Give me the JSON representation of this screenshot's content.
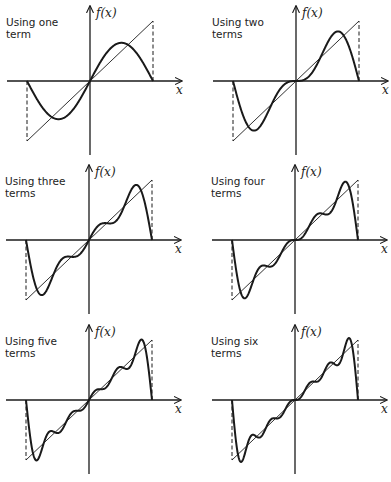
{
  "figure": {
    "background": "#ffffff",
    "ink": "#1a1a1a"
  },
  "chart_data": [
    {
      "type": "line",
      "title": "Using one term",
      "label_lines": [
        "Using one",
        "term"
      ],
      "terms": 1,
      "xlabel": "x",
      "ylabel": "f(x)",
      "xlim": [
        -3.1416,
        3.1416
      ],
      "series": [
        {
          "name": "f(x) = x",
          "style": "thin"
        },
        {
          "name": "Fourier partial sum (1 term)",
          "style": "thick"
        }
      ],
      "origin": [
        90,
        81
      ]
    },
    {
      "type": "line",
      "title": "Using two terms",
      "label_lines": [
        "Using two",
        "terms"
      ],
      "terms": 2,
      "xlabel": "x",
      "ylabel": "f(x)",
      "xlim": [
        -3.1416,
        3.1416
      ],
      "series": [
        {
          "name": "f(x) = x",
          "style": "thin"
        },
        {
          "name": "Fourier partial sum (2 terms)",
          "style": "thick"
        }
      ],
      "origin": [
        296,
        81
      ]
    },
    {
      "type": "line",
      "title": "Using three terms",
      "label_lines": [
        "Using three",
        "terms"
      ],
      "terms": 3,
      "xlabel": "x",
      "ylabel": "f(x)",
      "xlim": [
        -3.1416,
        3.1416
      ],
      "series": [
        {
          "name": "f(x) = x",
          "style": "thin"
        },
        {
          "name": "Fourier partial sum (3 terms)",
          "style": "thick"
        }
      ],
      "origin": [
        89,
        240
      ]
    },
    {
      "type": "line",
      "title": "Using four terms",
      "label_lines": [
        "Using four",
        "terms"
      ],
      "terms": 4,
      "xlabel": "x",
      "ylabel": "f(x)",
      "xlim": [
        -3.1416,
        3.1416
      ],
      "series": [
        {
          "name": "f(x) = x",
          "style": "thin"
        },
        {
          "name": "Fourier partial sum (4 terms)",
          "style": "thick"
        }
      ],
      "origin": [
        295,
        240
      ]
    },
    {
      "type": "line",
      "title": "Using five terms",
      "label_lines": [
        "Using five",
        "terms"
      ],
      "terms": 5,
      "xlabel": "x",
      "ylabel": "f(x)",
      "xlim": [
        -3.1416,
        3.1416
      ],
      "series": [
        {
          "name": "f(x) = x",
          "style": "thin"
        },
        {
          "name": "Fourier partial sum (5 terms)",
          "style": "thick"
        }
      ],
      "origin": [
        89,
        400
      ]
    },
    {
      "type": "line",
      "title": "Using six terms",
      "label_lines": [
        "Using six",
        "terms"
      ],
      "terms": 6,
      "xlabel": "x",
      "ylabel": "f(x)",
      "xlim": [
        -3.1416,
        3.1416
      ],
      "series": [
        {
          "name": "f(x) = x",
          "style": "thin"
        },
        {
          "name": "Fourier partial sum (6 terms)",
          "style": "thick"
        }
      ],
      "origin": [
        295,
        400
      ]
    }
  ],
  "layout": {
    "half_width_px": 63,
    "half_height_px": 60,
    "x_axis_left_extent": 83,
    "x_axis_right_extent": 92,
    "y_axis_up_extent": 75,
    "y_axis_down_extent": 74,
    "label_offset": [
      -84,
      -55
    ]
  }
}
